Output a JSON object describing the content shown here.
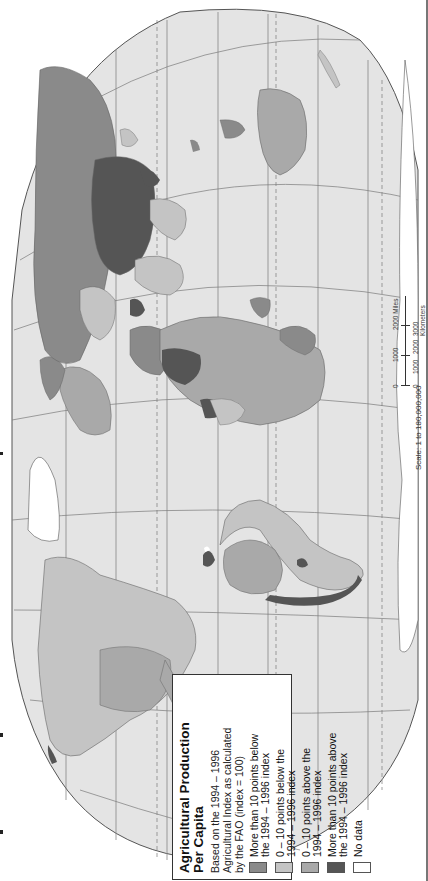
{
  "map": {
    "orientation": "rotated-90-ccw",
    "title": "Agricultural Production Per Capita",
    "title_line1": "Agricultural Production",
    "title_line2": "Per Capita",
    "subtitle_line1": "Based on the 1994 – 1996",
    "subtitle_line2": "Agricultural Index as calculated",
    "subtitle_line3": "by the FAO (index = 100)",
    "colors": {
      "ocean": "#e4e4e4",
      "more_than_10_below": "#8a8a8a",
      "zero_to_10_below": "#c4c4c4",
      "zero_to_10_above": "#a9a9a9",
      "more_than_10_above": "#555555",
      "no_data": "#ffffff",
      "graticule": "#7a7a7a",
      "outline": "#555555"
    }
  },
  "legend": {
    "items": [
      {
        "label_line1": "More than 10 points below",
        "label_line2": "the 1994 – 1996 index",
        "color": "#8a8a8a"
      },
      {
        "label_line1": "0 – 10 points below the",
        "label_line2": "1994 – 1996 index",
        "color": "#c4c4c4"
      },
      {
        "label_line1": "0 – 10 points above the",
        "label_line2": "1994 – 1996 index",
        "color": "#a9a9a9"
      },
      {
        "label_line1": "More than 10 points above",
        "label_line2": "the 1994 – 1996 index",
        "color": "#555555"
      },
      {
        "label_line1": "No data",
        "label_line2": "",
        "color": "#ffffff"
      }
    ]
  },
  "scale": {
    "caption": "Scale: 1 to 180,000,000",
    "miles_ticks": [
      "0",
      "1000",
      "2000 Miles"
    ],
    "km_ticks": [
      "0",
      "1000",
      "2000",
      "3000 Kilometers"
    ]
  }
}
